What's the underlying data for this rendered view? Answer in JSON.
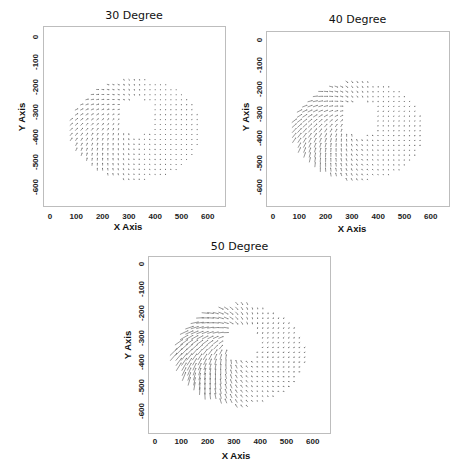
{
  "chart_data": [
    {
      "type": "quiver",
      "title": "30 Degree",
      "xlabel": "X Axis",
      "ylabel": "Y Axis",
      "xticks": [
        0,
        100,
        200,
        300,
        400,
        500,
        600
      ],
      "yticks": [
        0,
        -100,
        -200,
        -300,
        -400,
        -500,
        -600
      ],
      "xlim": [
        -30,
        660
      ],
      "ylim": [
        -680,
        30
      ],
      "grid": false,
      "field": {
        "x_range": [
          80,
          570
        ],
        "y_range": [
          -570,
          -170
        ],
        "step": 20,
        "hole_center": [
          330,
          -320
        ],
        "hole_radius": 70,
        "strength": 0.35
      }
    },
    {
      "type": "quiver",
      "title": "40 Degree",
      "xlabel": "X Axis",
      "ylabel": "Y Axis",
      "xticks": [
        0,
        100,
        200,
        300,
        400,
        500,
        600
      ],
      "yticks": [
        0,
        -100,
        -200,
        -300,
        -400,
        -500,
        -600
      ],
      "xlim": [
        -30,
        660
      ],
      "ylim": [
        -680,
        30
      ],
      "grid": false,
      "field": {
        "x_range": [
          80,
          570
        ],
        "y_range": [
          -570,
          -170
        ],
        "step": 20,
        "hole_center": [
          330,
          -320
        ],
        "hole_radius": 70,
        "strength": 0.6
      }
    },
    {
      "type": "quiver",
      "title": "50 Degree",
      "xlabel": "X Axis",
      "ylabel": "Y Axis",
      "xticks": [
        0,
        100,
        200,
        300,
        400,
        500,
        600
      ],
      "yticks": [
        0,
        -100,
        -200,
        -300,
        -400,
        -500,
        -600
      ],
      "xlim": [
        -30,
        660
      ],
      "ylim": [
        -680,
        30
      ],
      "grid": false,
      "field": {
        "x_range": [
          70,
          570
        ],
        "y_range": [
          -580,
          -160
        ],
        "step": 20,
        "hole_center": [
          330,
          -320
        ],
        "hole_radius": 70,
        "strength": 1.0
      }
    }
  ],
  "panels": [
    {
      "title": "30 Degree",
      "xlabel": "X Axis",
      "ylabel": "Y Axis"
    },
    {
      "title": "40 Degree",
      "xlabel": "X Axis",
      "ylabel": "Y Axis"
    },
    {
      "title": "50 Degree",
      "xlabel": "X Axis",
      "ylabel": "Y Axis"
    }
  ],
  "colors": {
    "arrow": "#6f6f6f",
    "frame": "#bdbdbd"
  }
}
